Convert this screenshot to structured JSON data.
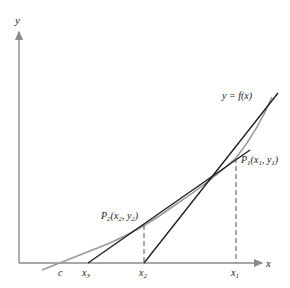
{
  "diagram": {
    "axes": {
      "x_label": "x",
      "y_label": "y"
    },
    "curve_label": "y = f(x)",
    "points": [
      {
        "name": "P1",
        "label": "P",
        "sub": "1",
        "coords": "(x",
        "coords_sub1": "1",
        "mid": ", y",
        "coords_sub2": "1",
        "close": ")"
      },
      {
        "name": "P2",
        "label": "P",
        "sub": "2",
        "coords": "(x",
        "coords_sub1": "2",
        "mid": ", y",
        "coords_sub2": "2",
        "close": ")"
      }
    ],
    "x_ticks": [
      {
        "name": "c",
        "label": "c",
        "sub": ""
      },
      {
        "name": "x3",
        "label": "x",
        "sub": "3"
      },
      {
        "name": "x2",
        "label": "x",
        "sub": "2"
      },
      {
        "name": "x1",
        "label": "x",
        "sub": "1"
      }
    ],
    "colors": {
      "axis": "#8a8a8a",
      "curve": "#9a9a9a",
      "tangent": "#1a1a1a",
      "dashed": "#555555"
    }
  }
}
